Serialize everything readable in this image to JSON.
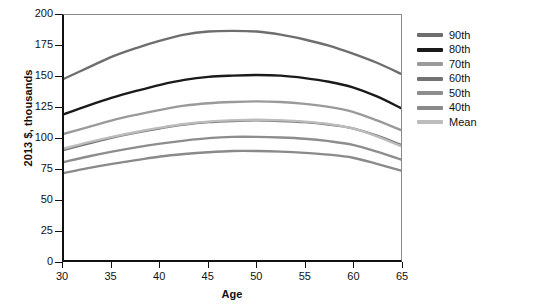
{
  "chart_data": {
    "type": "line",
    "title": "",
    "xlabel": "Age",
    "ylabel": "2013 $, thousands",
    "xlim": [
      30,
      65
    ],
    "ylim": [
      0,
      200
    ],
    "xticks": [
      30,
      35,
      40,
      45,
      50,
      55,
      60,
      65
    ],
    "yticks": [
      0,
      25,
      50,
      75,
      100,
      125,
      150,
      175,
      200
    ],
    "grid": false,
    "legend_position": "right",
    "x": [
      30,
      32.5,
      35,
      37.5,
      40,
      42.5,
      45,
      47.5,
      50,
      52.5,
      55,
      57.5,
      60,
      62.5,
      65
    ],
    "series": [
      {
        "name": "90th",
        "color": "#6e6e6e",
        "values": [
          148,
          157,
          166,
          173,
          179,
          184,
          186.5,
          187,
          186.5,
          184,
          180,
          175,
          168.5,
          161,
          152
        ]
      },
      {
        "name": "80th",
        "color": "#1a1a1a",
        "values": [
          119,
          126,
          132.5,
          138,
          143,
          147,
          149.5,
          150.5,
          151,
          150.5,
          148.5,
          145.5,
          141,
          133.5,
          124
        ]
      },
      {
        "name": "70th",
        "color": "#9a9a9a",
        "values": [
          103,
          108.5,
          114,
          118.5,
          122.5,
          126,
          128,
          129,
          129.5,
          129,
          127.5,
          125,
          121,
          114,
          106
        ]
      },
      {
        "name": "60th",
        "color": "#737373",
        "values": [
          90,
          95,
          100,
          104,
          107.5,
          110.5,
          112.5,
          113.5,
          114,
          113.5,
          112.5,
          110.5,
          107.5,
          101.5,
          94
        ]
      },
      {
        "name": "50th",
        "color": "#8d8d8d",
        "values": [
          80,
          84.5,
          88.5,
          92,
          95,
          97.5,
          99.5,
          100.5,
          100.5,
          100,
          99,
          97,
          94,
          88.5,
          82
        ]
      },
      {
        "name": "40th",
        "color": "#8a8a8a",
        "values": [
          71,
          75,
          78.5,
          81.5,
          84.5,
          86.5,
          88,
          89,
          89,
          88.5,
          87.5,
          86,
          83.5,
          78.5,
          73
        ]
      },
      {
        "name": "Mean",
        "color": "#bcbcbc",
        "values": [
          91,
          96,
          100.5,
          104.5,
          108,
          111,
          113,
          114,
          114.5,
          114,
          113,
          111,
          107.5,
          101,
          93
        ]
      }
    ]
  },
  "axes": {
    "y_title": "2013 $, thousands",
    "x_title": "Age",
    "y_tick_labels": [
      "200",
      "175",
      "150",
      "125",
      "100",
      "75",
      "50",
      "25",
      "0"
    ],
    "x_tick_labels": [
      "30",
      "35",
      "40",
      "45",
      "50",
      "55",
      "60",
      "65"
    ]
  },
  "legend": {
    "items": [
      {
        "label": "90th",
        "color": "#6e6e6e"
      },
      {
        "label": "80th",
        "color": "#1a1a1a"
      },
      {
        "label": "70th",
        "color": "#9a9a9a"
      },
      {
        "label": "60th",
        "color": "#737373"
      },
      {
        "label": "50th",
        "color": "#8d8d8d"
      },
      {
        "label": "40th",
        "color": "#8a8a8a"
      },
      {
        "label": "Mean",
        "color": "#bcbcbc"
      }
    ]
  }
}
